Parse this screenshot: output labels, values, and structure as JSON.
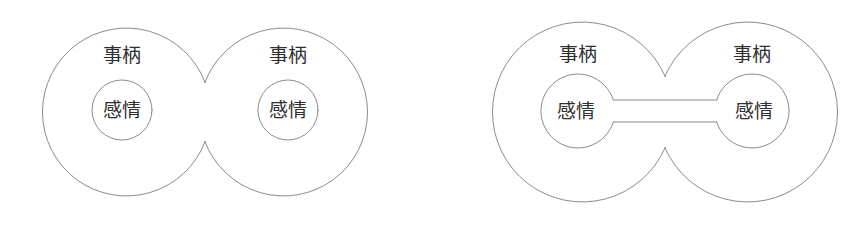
{
  "figure": {
    "title": "",
    "background_color": "#ffffff",
    "stroke_color": "#8b8b8b",
    "text_color": "#2e2e2e",
    "diagrams": [
      {
        "id": "left-diagram",
        "name": "unconnected-emotion-pair",
        "connector": false,
        "lobes": [
          {
            "id": "left-diagram-lobe-1",
            "outer_label": "事柄",
            "inner_label": "感情"
          },
          {
            "id": "left-diagram-lobe-2",
            "outer_label": "事柄",
            "inner_label": "感情"
          }
        ]
      },
      {
        "id": "right-diagram",
        "name": "connected-emotion-pair",
        "connector": true,
        "connector_name": "emotion-link-tube",
        "lobes": [
          {
            "id": "right-diagram-lobe-1",
            "outer_label": "事柄",
            "inner_label": "感情"
          },
          {
            "id": "right-diagram-lobe-2",
            "outer_label": "事柄",
            "inner_label": "感情"
          }
        ]
      }
    ]
  }
}
